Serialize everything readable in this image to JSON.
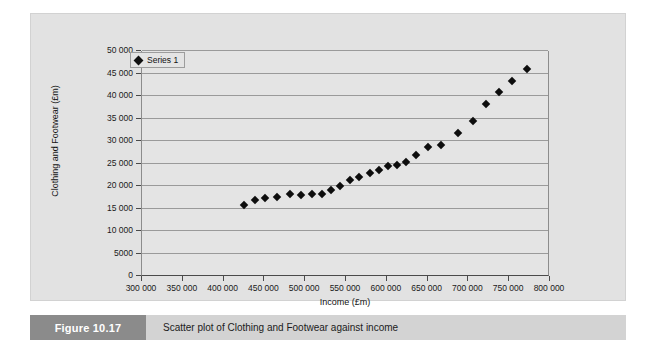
{
  "figure": {
    "tag": "Figure 10.17",
    "caption": "Scatter plot of Clothing and Footwear against income"
  },
  "legend": {
    "entries": [
      {
        "label": "Series 1",
        "marker": "diamond-marker-icon",
        "color": "#0d0d0d"
      }
    ],
    "position": "top-left-inside"
  },
  "colors": {
    "page_background": "#ffffff",
    "panel_background": "#e2e2e2",
    "plot_background": "#e4e4e4",
    "gridline": "#9a9a9a",
    "axis": "#4a4a4a",
    "marker": "#0d0d0d",
    "caption_bar": "#d3d3d3",
    "caption_tag": "#8b8b8b",
    "caption_tag_text": "#ffffff"
  },
  "chart_data": {
    "type": "scatter",
    "title": "",
    "subtitle": "",
    "xlabel": "Income (£m)",
    "ylabel": "Clothing and Footwear (£m)",
    "xlim": [
      300000,
      800000
    ],
    "ylim": [
      0,
      50000
    ],
    "xticks": [
      300000,
      350000,
      400000,
      450000,
      500000,
      550000,
      600000,
      650000,
      700000,
      750000,
      800000
    ],
    "xticklabels": [
      "300 000",
      "350 000",
      "400 000",
      "450 000",
      "500 000",
      "550 000",
      "600 000",
      "650 000",
      "700 000",
      "750 000",
      "800 000"
    ],
    "yticks": [
      0,
      5000,
      10000,
      15000,
      20000,
      25000,
      30000,
      35000,
      40000,
      45000,
      50000
    ],
    "yticklabels": [
      "0",
      "5000",
      "10 000",
      "15 000",
      "20 000",
      "25 000",
      "30 000",
      "35 000",
      "40 000",
      "45 000",
      "50 000"
    ],
    "grid": {
      "horizontal": true,
      "vertical": false
    },
    "legend_position": "upper left",
    "series": [
      {
        "name": "Series 1",
        "marker": "diamond",
        "color": "#0d0d0d",
        "points": [
          [
            425000,
            15700
          ],
          [
            439000,
            16900
          ],
          [
            451000,
            17400
          ],
          [
            466000,
            17600
          ],
          [
            481000,
            18200
          ],
          [
            495000,
            17900
          ],
          [
            508000,
            18200
          ],
          [
            521000,
            18300
          ],
          [
            532000,
            19200
          ],
          [
            543000,
            20100
          ],
          [
            555000,
            21400
          ],
          [
            566000,
            22000
          ],
          [
            579000,
            23000
          ],
          [
            590000,
            23600
          ],
          [
            602000,
            24400
          ],
          [
            613000,
            24700
          ],
          [
            624000,
            25400
          ],
          [
            636000,
            26800
          ],
          [
            650000,
            28600
          ],
          [
            666000,
            29200
          ],
          [
            687000,
            31700
          ],
          [
            706000,
            34400
          ],
          [
            722000,
            38200
          ],
          [
            738000,
            41000
          ],
          [
            754000,
            43400
          ],
          [
            772000,
            46000
          ]
        ]
      }
    ]
  }
}
